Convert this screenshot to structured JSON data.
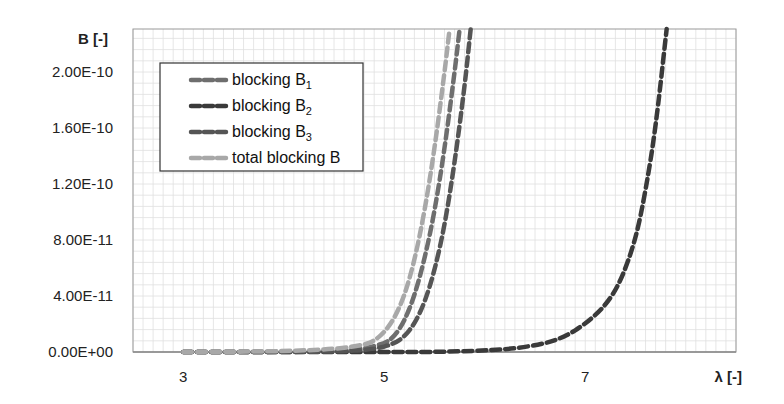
{
  "chart_data": {
    "type": "line",
    "title": "",
    "xlabel": "λ [-]",
    "ylabel": "B [-]",
    "xlim": [
      2.5,
      8.5
    ],
    "ylim": [
      0,
      2.31e-10
    ],
    "x_ticks": [
      3,
      5,
      7
    ],
    "x_tick_labels": [
      "3",
      "5",
      "7"
    ],
    "y_ticks": [
      0,
      4e-11,
      8e-11,
      1.2e-10,
      1.6e-10,
      2e-10
    ],
    "y_tick_labels": [
      "0.00E+00",
      "4.00E-11",
      "8.00E-11",
      "1.20E-10",
      "1.60E-10",
      "2.00E-10"
    ],
    "grid": true,
    "legend_position": "top-left",
    "series": [
      {
        "name": "blocking B1",
        "label_main": "blocking B",
        "label_sub": "1",
        "color": "#6e6e6e",
        "x": [
          3.0,
          3.5,
          4.0,
          4.5,
          4.8,
          5.0,
          5.1,
          5.2,
          5.3,
          5.4,
          5.5,
          5.6,
          5.7,
          5.75
        ],
        "y": [
          0,
          0,
          1e-13,
          6e-13,
          2.5e-12,
          6e-12,
          1.1e-11,
          2.2e-11,
          4e-11,
          6.6e-11,
          1e-10,
          1.45e-10,
          2e-10,
          2.31e-10
        ]
      },
      {
        "name": "blocking B2",
        "label_main": "blocking B",
        "label_sub": "2",
        "color": "#3a3a3a",
        "x": [
          3.0,
          4.0,
          5.0,
          5.5,
          6.0,
          6.3,
          6.6,
          6.8,
          7.0,
          7.2,
          7.35,
          7.5,
          7.6,
          7.7,
          7.81
        ],
        "y": [
          0,
          0,
          0,
          0,
          1e-12,
          2.5e-12,
          6e-12,
          1.1e-11,
          2e-11,
          3.3e-11,
          5e-11,
          8e-11,
          1.15e-10,
          1.6e-10,
          2.31e-10
        ]
      },
      {
        "name": "blocking B3",
        "label_main": "blocking B",
        "label_sub": "3",
        "color": "#555555",
        "x": [
          3.0,
          3.5,
          4.0,
          4.5,
          4.9,
          5.1,
          5.2,
          5.3,
          5.4,
          5.5,
          5.6,
          5.7,
          5.8,
          5.86
        ],
        "y": [
          0,
          0,
          0,
          3e-13,
          1.8e-12,
          6e-12,
          1.1e-11,
          2e-11,
          3.5e-11,
          5.8e-11,
          9e-11,
          1.35e-10,
          1.9e-10,
          2.31e-10
        ]
      },
      {
        "name": "total blocking B",
        "label_main": "total blocking B",
        "label_sub": "",
        "color": "#a8a8a8",
        "x": [
          3.0,
          3.5,
          4.0,
          4.5,
          4.8,
          4.9,
          5.0,
          5.1,
          5.2,
          5.3,
          5.4,
          5.5,
          5.6,
          5.65
        ],
        "y": [
          0,
          2e-13,
          6e-13,
          2e-12,
          5e-12,
          8e-12,
          1.4e-11,
          2.4e-11,
          4e-11,
          6.5e-11,
          1e-10,
          1.45e-10,
          2e-10,
          2.31e-10
        ]
      }
    ]
  }
}
